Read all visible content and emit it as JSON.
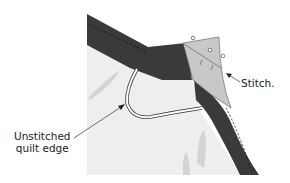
{
  "diagram": {
    "labels": {
      "stitch": "Stitch.",
      "unstitched_line1": "Unstitched",
      "unstitched_line2": "quilt edge"
    },
    "colors": {
      "binding": "#3a3a3a",
      "quilt": "#eeeeee",
      "fold": "#c8c8c8",
      "motif": "#cfcfcf",
      "background": "#ffffff"
    }
  }
}
